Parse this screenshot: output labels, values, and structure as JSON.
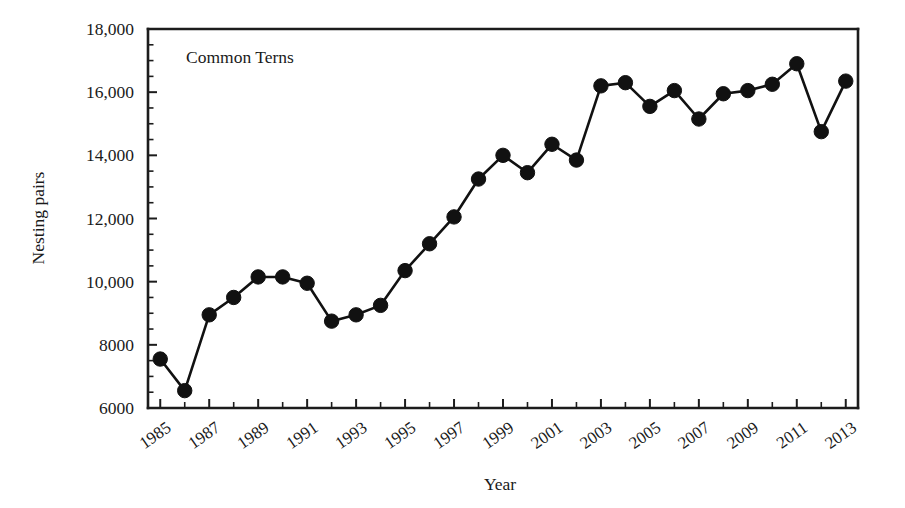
{
  "chart_data": {
    "type": "line",
    "title": "",
    "annotation": "Common Terns",
    "xlabel": "Year",
    "ylabel": "Nesting pairs",
    "grid": false,
    "legend": "none",
    "marker": "filled-circle",
    "xlim": [
      1984.5,
      2013.5
    ],
    "ylim": [
      6000,
      18000
    ],
    "y_ticks": [
      6000,
      8000,
      10000,
      12000,
      14000,
      16000,
      18000
    ],
    "y_tick_labels": [
      "6000",
      "8000",
      "10,000",
      "12,000",
      "14,000",
      "16,000",
      "18,000"
    ],
    "y_minor_tick_step": 500,
    "x_ticks": [
      1985,
      1986,
      1987,
      1988,
      1989,
      1990,
      1991,
      1992,
      1993,
      1994,
      1995,
      1996,
      1997,
      1998,
      1999,
      2000,
      2001,
      2002,
      2003,
      2004,
      2005,
      2006,
      2007,
      2008,
      2009,
      2010,
      2011,
      2012,
      2013
    ],
    "x_tick_labels_shown": [
      "1985",
      "1987",
      "1989",
      "1991",
      "1993",
      "1995",
      "1997",
      "1999",
      "2001",
      "2003",
      "2005",
      "2007",
      "2009",
      "2011",
      "2013"
    ],
    "x_tick_label_rotation_deg": -35,
    "x": [
      1985,
      1986,
      1987,
      1988,
      1989,
      1990,
      1991,
      1992,
      1993,
      1994,
      1995,
      1996,
      1997,
      1998,
      1999,
      2000,
      2001,
      2002,
      2003,
      2004,
      2005,
      2006,
      2007,
      2008,
      2009,
      2010,
      2011,
      2012,
      2013
    ],
    "values": [
      7550,
      6550,
      8950,
      9500,
      10150,
      10150,
      9950,
      8750,
      8950,
      9250,
      10350,
      11200,
      12050,
      13250,
      14000,
      13450,
      14350,
      13850,
      16200,
      16300,
      15550,
      16050,
      15150,
      15950,
      16050,
      16250,
      16900,
      14750,
      16350
    ],
    "series": [
      {
        "name": "Common Terns nesting pairs",
        "values": [
          7550,
          6550,
          8950,
          9500,
          10150,
          10150,
          9950,
          8750,
          8950,
          9250,
          10350,
          11200,
          12050,
          13250,
          14000,
          13450,
          14350,
          13850,
          16200,
          16300,
          15550,
          16050,
          15150,
          15950,
          16050,
          16250,
          16900,
          14750,
          16350
        ]
      }
    ],
    "colors": {
      "line": "#111111",
      "marker": "#111111",
      "axis": "#1c1c1c",
      "background": "#ffffff"
    }
  }
}
